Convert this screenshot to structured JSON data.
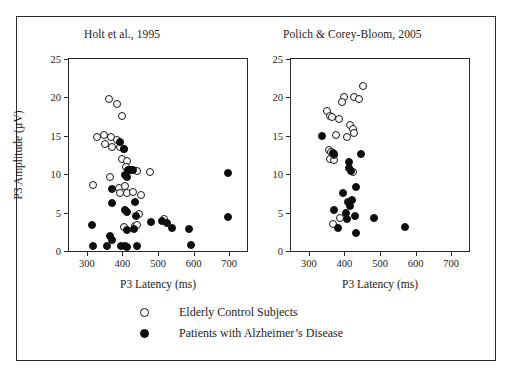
{
  "figure": {
    "xlabel": "P3 Latency (ms)",
    "ylabel": "P3 Amplitude (µV)"
  },
  "legend": {
    "items": [
      {
        "marker": "open-circle-icon",
        "label": "Elderly Control Subjects"
      },
      {
        "marker": "filled-circle-icon",
        "label": "Patients with Alzheimer’s Disease"
      }
    ]
  },
  "chart_data": [
    {
      "type": "scatter",
      "title": "Holt et al., 1995",
      "xlabel": "P3 Latency (ms)",
      "ylabel": "P3 Amplitude (µV)",
      "xlim": [
        250,
        750
      ],
      "ylim": [
        0,
        25
      ],
      "xticks": [
        300,
        400,
        500,
        600,
        700
      ],
      "yticks": [
        0,
        5,
        10,
        15,
        20,
        25
      ],
      "grid": false,
      "legend_position": "below-figure",
      "series": [
        {
          "name": "Elderly Control Subjects",
          "marker": "open-circle",
          "points": [
            [
              362,
              19.8
            ],
            [
              384,
              19.1
            ],
            [
              400,
              17.6
            ],
            [
              330,
              14.8
            ],
            [
              348,
              15.1
            ],
            [
              368,
              14.8
            ],
            [
              386,
              14.5
            ],
            [
              352,
              13.9
            ],
            [
              370,
              13.5
            ],
            [
              392,
              13.6
            ],
            [
              404,
              13.3
            ],
            [
              398,
              12.0
            ],
            [
              412,
              11.7
            ],
            [
              410,
              10.9
            ],
            [
              440,
              10.4
            ],
            [
              478,
              10.3
            ],
            [
              366,
              9.6
            ],
            [
              318,
              8.6
            ],
            [
              390,
              8.2
            ],
            [
              408,
              8.4
            ],
            [
              392,
              7.6
            ],
            [
              414,
              7.5
            ],
            [
              430,
              7.7
            ],
            [
              452,
              7.3
            ],
            [
              446,
              4.8
            ],
            [
              516,
              4.2
            ],
            [
              404,
              3.1
            ],
            [
              434,
              3.3
            ],
            [
              442,
              3.4
            ]
          ]
        },
        {
          "name": "Patients with Alzheimer's Disease",
          "marker": "filled-circle",
          "points": [
            [
              392,
              14.2
            ],
            [
              404,
              13.3
            ],
            [
              416,
              10.6
            ],
            [
              424,
              10.5
            ],
            [
              430,
              10.5
            ],
            [
              696,
              10.1
            ],
            [
              406,
              9.9
            ],
            [
              412,
              9.6
            ],
            [
              370,
              8.1
            ],
            [
              372,
              6.2
            ],
            [
              406,
              5.4
            ],
            [
              414,
              5.1
            ],
            [
              436,
              6.4
            ],
            [
              438,
              4.6
            ],
            [
              696,
              4.4
            ],
            [
              316,
              3.4
            ],
            [
              480,
              3.8
            ],
            [
              512,
              3.9
            ],
            [
              524,
              3.7
            ],
            [
              540,
              3.0
            ],
            [
              588,
              2.9
            ],
            [
              414,
              2.7
            ],
            [
              432,
              2.8
            ],
            [
              366,
              2.0
            ],
            [
              372,
              1.4
            ],
            [
              318,
              0.6
            ],
            [
              358,
              0.6
            ],
            [
              396,
              0.7
            ],
            [
              406,
              0.6
            ],
            [
              412,
              0.5
            ],
            [
              440,
              0.6
            ],
            [
              592,
              0.8
            ]
          ]
        }
      ]
    },
    {
      "type": "scatter",
      "title": "Polich & Corey-Bloom, 2005",
      "xlabel": "P3 Latency (ms)",
      "ylabel": "P3 Amplitude (µV)",
      "xlim": [
        250,
        750
      ],
      "ylim": [
        0,
        25
      ],
      "xticks": [
        300,
        400,
        500,
        600,
        700
      ],
      "yticks": [
        0,
        5,
        10,
        15,
        20,
        25
      ],
      "grid": false,
      "legend_position": "below-figure",
      "series": [
        {
          "name": "Elderly Control Subjects",
          "marker": "open-circle",
          "points": [
            [
              452,
              21.5
            ],
            [
              398,
              20.0
            ],
            [
              428,
              20.0
            ],
            [
              440,
              19.8
            ],
            [
              392,
              19.4
            ],
            [
              352,
              18.2
            ],
            [
              360,
              17.6
            ],
            [
              366,
              17.4
            ],
            [
              384,
              17.2
            ],
            [
              416,
              16.4
            ],
            [
              424,
              15.9
            ],
            [
              428,
              15.3
            ],
            [
              376,
              15.1
            ],
            [
              406,
              14.9
            ],
            [
              356,
              13.2
            ],
            [
              362,
              12.9
            ],
            [
              360,
              12.0
            ],
            [
              372,
              11.9
            ],
            [
              370,
              12.5
            ],
            [
              424,
              10.3
            ],
            [
              388,
              4.3
            ],
            [
              368,
              3.5
            ]
          ]
        },
        {
          "name": "Patients with Alzheimer's Disease",
          "marker": "filled-circle",
          "points": [
            [
              336,
              15.0
            ],
            [
              368,
              12.8
            ],
            [
              372,
              12.6
            ],
            [
              448,
              12.6
            ],
            [
              412,
              11.6
            ],
            [
              414,
              10.8
            ],
            [
              418,
              10.4
            ],
            [
              432,
              8.3
            ],
            [
              396,
              7.6
            ],
            [
              410,
              6.4
            ],
            [
              420,
              6.6
            ],
            [
              416,
              5.9
            ],
            [
              370,
              5.4
            ],
            [
              404,
              5.0
            ],
            [
              430,
              4.6
            ],
            [
              484,
              4.3
            ],
            [
              406,
              4.2
            ],
            [
              382,
              3.0
            ],
            [
              570,
              3.1
            ],
            [
              432,
              2.3
            ]
          ]
        }
      ]
    }
  ]
}
